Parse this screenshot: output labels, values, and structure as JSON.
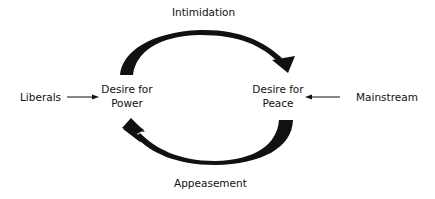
{
  "diagram": {
    "type": "cycle",
    "nodes": {
      "power": {
        "line1": "Desire for",
        "line2": "Power"
      },
      "peace": {
        "line1": "Desire for",
        "line2": "Peace"
      }
    },
    "cycle_edges": {
      "top": {
        "label": "Intimidation",
        "from": "Desire for Power",
        "to": "Desire for Peace"
      },
      "bottom": {
        "label": "Appeasement",
        "from": "Desire for Peace",
        "to": "Desire for Power"
      }
    },
    "inputs": {
      "left": {
        "label": "Liberals",
        "target": "Desire for Power"
      },
      "right": {
        "label": "Mainstream",
        "target": "Desire for Peace"
      }
    },
    "colors": {
      "ink": "#111111",
      "background": "#ffffff"
    }
  }
}
